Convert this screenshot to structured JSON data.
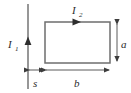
{
  "figure": {
    "type": "physics-circuit-diagram",
    "background_color": "#ffffff",
    "line_color": "#4a4a4a",
    "label_color": "#2b2b2b",
    "wire": {
      "name": "long-straight-wire",
      "current_label": "I",
      "current_subscript": "1",
      "direction": "up",
      "x": 28,
      "y_top": 4,
      "y_bottom": 89,
      "arrow_y": 41,
      "label_x": 12,
      "label_y": 46
    },
    "loop": {
      "name": "rectangular-loop",
      "current_label": "I",
      "current_subscript": "2",
      "direction": "clockwise",
      "left": 45,
      "top": 22,
      "right": 110,
      "bottom": 63,
      "arrow_x": 77,
      "label_x": 74,
      "label_y": 12
    },
    "dimensions": [
      {
        "name": "height-a",
        "label": "a",
        "orientation": "vertical",
        "axis_x": 117,
        "start": 22,
        "end": 63,
        "label_x": 123,
        "label_y": 46
      },
      {
        "name": "gap-s",
        "label": "s",
        "orientation": "horizontal",
        "axis_y": 70,
        "start": 28,
        "end": 45,
        "label_x": 34,
        "label_y": 85
      },
      {
        "name": "width-b",
        "label": "b",
        "orientation": "horizontal",
        "axis_y": 70,
        "start": 45,
        "end": 110,
        "label_x": 75,
        "label_y": 85
      }
    ]
  }
}
